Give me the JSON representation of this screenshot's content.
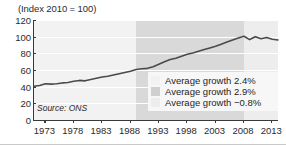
{
  "chart_data": {
    "type": "line",
    "title": "(Index 2010 = 100)",
    "xlabel": "",
    "ylabel": "",
    "ylim": [
      0,
      120
    ],
    "xlim": [
      1971,
      2014
    ],
    "yticks": [
      0,
      20,
      40,
      60,
      80,
      100,
      120
    ],
    "xticks": [
      1973,
      1978,
      1983,
      1988,
      1993,
      1998,
      2003,
      2008,
      2013
    ],
    "grid": true,
    "legend_position": "inside-lower-right",
    "source": "Source: ONS",
    "series": [
      {
        "name": "Index 2010 = 100",
        "color": "#4a4a4a",
        "x": [
          1971,
          1972,
          1973,
          1974,
          1975,
          1976,
          1977,
          1978,
          1979,
          1980,
          1981,
          1982,
          1983,
          1984,
          1985,
          1986,
          1987,
          1988,
          1989,
          1990,
          1991,
          1992,
          1993,
          1994,
          1995,
          1996,
          1997,
          1998,
          1999,
          2000,
          2001,
          2002,
          2003,
          2004,
          2005,
          2006,
          2007,
          2008,
          2009,
          2010,
          2011,
          2012,
          2013,
          2014
        ],
        "values": [
          40.5,
          41.5,
          43.5,
          43.0,
          43.5,
          44.5,
          45.0,
          46.5,
          47.5,
          47.0,
          48.5,
          50.0,
          51.5,
          52.5,
          54.0,
          55.5,
          57.0,
          58.5,
          60.5,
          61.5,
          62.0,
          64.0,
          67.0,
          70.0,
          72.5,
          74.0,
          76.5,
          79.0,
          80.5,
          82.5,
          84.5,
          86.5,
          88.5,
          91.0,
          93.5,
          96.0,
          98.5,
          100.5,
          96.5,
          100.0,
          97.5,
          99.0,
          97.0,
          96.0
        ]
      }
    ],
    "bands": [
      {
        "label": "Average growth 2.4%",
        "color": "#f2f2f2",
        "x_start": 1971,
        "x_end": 1989,
        "growth": 2.4
      },
      {
        "label": "Average growth 2.9%",
        "color": "#d9d9d9",
        "x_start": 1989,
        "x_end": 2008,
        "growth": 2.9
      },
      {
        "label": "Average growth -0.8%",
        "color": "#ededed",
        "x_start": 2008,
        "x_end": 2014,
        "growth": -0.8
      }
    ]
  },
  "legend": {
    "items": [
      {
        "label": "Average growth 2.4%",
        "color": "#f2f2f2"
      },
      {
        "label": "Average growth 2.9%",
        "color": "#d9d9d9"
      },
      {
        "label": "Average growth −0.8%",
        "color": "#ededed"
      }
    ]
  },
  "ytick_labels": [
    "120",
    "100",
    "80",
    "60",
    "40",
    "20",
    "0"
  ],
  "xtick_labels": [
    "1973",
    "1978",
    "1983",
    "1988",
    "1993",
    "1998",
    "2003",
    "2008",
    "2013"
  ],
  "colors": {
    "line": "#4a4a4a",
    "axis": "#3a3a3a",
    "text": "#2b2b2b",
    "grid": "#ffffff"
  }
}
